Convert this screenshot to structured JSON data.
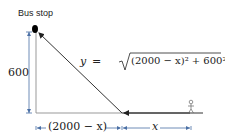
{
  "diagram": {
    "title_label": "Bus stop",
    "height_label": "600",
    "equation": {
      "lhs": "y",
      "eq": "=",
      "radicand": "(2000 − x)² + 600²"
    },
    "bottom_left_label": "(2000 − x)",
    "bottom_right_label": "x",
    "colors": {
      "line": "#333333",
      "ground": "#888888",
      "dimension": "#4a6fa5",
      "dot": "#000000"
    }
  }
}
